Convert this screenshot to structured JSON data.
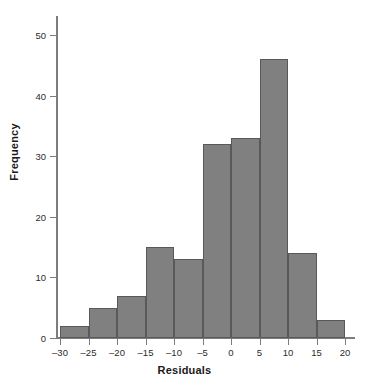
{
  "chart_data": {
    "type": "bar",
    "title": "",
    "xlabel": "Residuals",
    "ylabel": "Frequency",
    "bin_edges": [
      -30,
      -25,
      -20,
      -15,
      -10,
      -5,
      0,
      5,
      10,
      15,
      20
    ],
    "categories": [
      "-30 to -25",
      "-25 to -20",
      "-20 to -15",
      "-15 to -10",
      "-10 to -5",
      "-5 to 0",
      "0 to 5",
      "5 to 10",
      "10 to 15",
      "15 to 20"
    ],
    "values": [
      2,
      5,
      7,
      15,
      13,
      32,
      33,
      46,
      14,
      3
    ],
    "xlim": [
      -30,
      20
    ],
    "ylim": [
      0,
      52
    ],
    "xticks": [
      -30,
      -25,
      -20,
      -15,
      -10,
      -5,
      0,
      5,
      10,
      15,
      20
    ],
    "xtick_labels": [
      "–30",
      "–25",
      "–20",
      "–15",
      "–10",
      "–5",
      "0",
      "5",
      "10",
      "15",
      "20"
    ],
    "yticks": [
      0,
      10,
      20,
      30,
      40,
      50
    ],
    "ytick_labels": [
      "0",
      "10",
      "20",
      "30",
      "40",
      "50"
    ],
    "grid": false,
    "legend": false,
    "bar_color": "#808080",
    "bar_edge_color": "#595959",
    "axis_color": "#7d7d7d"
  }
}
